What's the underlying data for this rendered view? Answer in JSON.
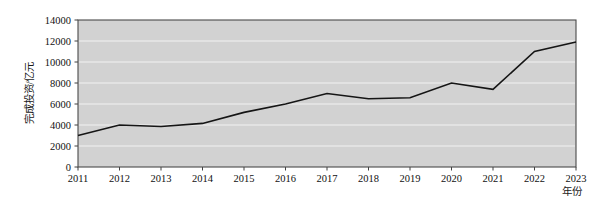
{
  "chart_data": {
    "type": "line",
    "title": "",
    "xlabel": "年份",
    "ylabel": "完成投资/亿元",
    "categories": [
      "2011",
      "2012",
      "2013",
      "2014",
      "2015",
      "2016",
      "2017",
      "2018",
      "2019",
      "2020",
      "2021",
      "2022",
      "2023"
    ],
    "values": [
      3000,
      4000,
      3850,
      4150,
      5200,
      6000,
      7000,
      6500,
      6600,
      8000,
      7400,
      11000,
      11900
    ],
    "series": [
      {
        "name": "完成投资",
        "values": [
          3000,
          4000,
          3850,
          4150,
          5200,
          6000,
          7000,
          6500,
          6600,
          8000,
          7400,
          11000,
          11900
        ]
      }
    ],
    "x": [
      "2011",
      "2012",
      "2013",
      "2014",
      "2015",
      "2016",
      "2017",
      "2018",
      "2019",
      "2020",
      "2021",
      "2022",
      "2023"
    ],
    "ylim": [
      0,
      14000
    ],
    "yticks": [
      0,
      2000,
      4000,
      6000,
      8000,
      10000,
      12000,
      14000
    ],
    "ytick_labels": [
      "0",
      "2000",
      "4000",
      "6000",
      "8000",
      "10000",
      "12000",
      "14000"
    ],
    "xtick_labels": [
      "2011",
      "2012",
      "2013",
      "2014",
      "2015",
      "2016",
      "2017",
      "2018",
      "2019",
      "2020",
      "2021",
      "2022",
      "2023"
    ],
    "grid": true,
    "grid_axis": "y",
    "legend": false,
    "legend_position": "none",
    "plot_background_color": "#d2d2d2",
    "line_color": "#151515",
    "gridline_color": "#f2f2f2",
    "frame_color": "#4a4a4a"
  },
  "axes": {
    "y_title": "完成投资/亿元",
    "x_title": "年份"
  }
}
